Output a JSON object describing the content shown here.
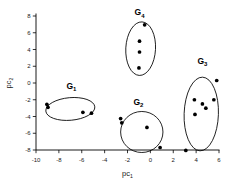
{
  "chart_data": {
    "type": "scatter",
    "title": "",
    "xlabel": "pc1",
    "ylabel": "pc2",
    "xlabel_base": "pc",
    "xlabel_sub": "1",
    "ylabel_base": "pc",
    "ylabel_sub": "2",
    "xlim": [
      -10,
      6
    ],
    "ylim": [
      -8,
      8
    ],
    "xticks": [
      -10,
      -8,
      -6,
      -4,
      -2,
      0,
      2,
      4,
      6
    ],
    "xtick_labels": [
      "-10",
      "-8",
      "-6",
      "-4",
      "-2",
      "0",
      "2",
      "4",
      "6"
    ],
    "yticks": [
      -8,
      -6,
      -4,
      -2,
      0,
      2,
      4,
      6,
      8
    ],
    "ytick_labels": [
      "-8",
      "-6",
      "-4",
      "-2",
      "0",
      "2",
      "4",
      "6",
      "8"
    ],
    "grid": false,
    "legend": "none",
    "marker_color": "#000000",
    "outline_color": "#000000",
    "series": [
      {
        "name": "G1",
        "label_base": "G",
        "label_sub": "1",
        "label_x": -6.9,
        "label_y": -0.7,
        "hull": {
          "shape": "ellipse",
          "cx": -7.0,
          "cy": -3.1,
          "rx": 2.15,
          "ry": 1.35,
          "rotation": -5
        },
        "points": [
          {
            "x": -9.05,
            "y": -2.55
          },
          {
            "x": -8.95,
            "y": -2.9
          },
          {
            "x": -5.9,
            "y": -3.5
          },
          {
            "x": -5.15,
            "y": -3.6
          }
        ]
      },
      {
        "name": "G2",
        "label_base": "G",
        "label_sub": "2",
        "label_x": -1.05,
        "label_y": -2.6,
        "hull": {
          "shape": "ellipse",
          "cx": -0.75,
          "cy": -5.85,
          "rx": 1.85,
          "ry": 2.45,
          "rotation": 0
        },
        "points": [
          {
            "x": -2.6,
            "y": -4.25
          },
          {
            "x": -2.5,
            "y": -4.75
          },
          {
            "x": -0.3,
            "y": -5.3
          },
          {
            "x": 0.85,
            "y": -7.7
          }
        ]
      },
      {
        "name": "G3",
        "label_base": "G",
        "label_sub": "3",
        "label_x": 4.55,
        "label_y": 2.3,
        "hull": {
          "shape": "ellipse",
          "cx": 4.45,
          "cy": -3.7,
          "rx": 1.5,
          "ry": 4.4,
          "rotation": 2
        },
        "points": [
          {
            "x": 5.8,
            "y": 0.3
          },
          {
            "x": 3.85,
            "y": -2.0
          },
          {
            "x": 5.55,
            "y": -2.0
          },
          {
            "x": 4.55,
            "y": -2.5
          },
          {
            "x": 4.85,
            "y": -3.0
          },
          {
            "x": 3.9,
            "y": -3.75
          },
          {
            "x": 3.1,
            "y": -8.05
          }
        ]
      },
      {
        "name": "G4",
        "label_base": "G",
        "label_sub": "4",
        "label_x": -0.95,
        "label_y": 8.1,
        "hull": {
          "shape": "ellipse",
          "cx": -0.85,
          "cy": 4.1,
          "rx": 1.3,
          "ry": 3.2,
          "rotation": 3
        },
        "points": [
          {
            "x": -0.5,
            "y": 6.95
          },
          {
            "x": -0.95,
            "y": 5.0
          },
          {
            "x": -0.95,
            "y": 3.7
          },
          {
            "x": -1.0,
            "y": 1.8
          }
        ]
      }
    ]
  }
}
